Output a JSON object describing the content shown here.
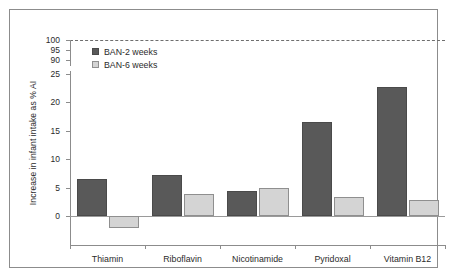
{
  "chart_data": {
    "type": "bar",
    "title": "",
    "xlabel": "",
    "ylabel": "Increase in infant intake as % AI",
    "categories": [
      "Thiamin",
      "Riboflavin",
      "Nicotinamide",
      "Pyridoxal",
      "Vitamin B12"
    ],
    "series": [
      {
        "name": "BAN-2 weeks",
        "color": "#595959",
        "values": [
          6.6,
          7.3,
          4.4,
          16.5,
          22.7
        ]
      },
      {
        "name": "BAN-6 weeks",
        "color": "#d4d4d4",
        "values": [
          -2.2,
          3.9,
          5.0,
          3.4,
          2.8
        ]
      }
    ],
    "ytick_labels": [
      "100",
      "95",
      "90",
      "25",
      "20",
      "15",
      "10",
      "5",
      "0"
    ],
    "ylim": [
      -3.2,
      25
    ],
    "axis_break": true,
    "break_note": "y-axis is broken: 90/95/100 shown above the 25 tick",
    "reference_line": {
      "value": 100,
      "style": "dashed"
    },
    "grid": false,
    "legend_position": "top-left"
  },
  "legend": {
    "items": [
      {
        "label": "BAN-2 weeks"
      },
      {
        "label": "BAN-6 weeks"
      }
    ]
  },
  "axis": {
    "y_title": "Increase in infant intake as % AI"
  }
}
